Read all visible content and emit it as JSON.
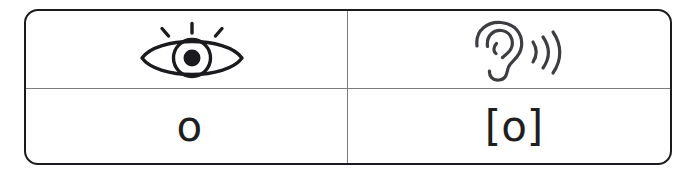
{
  "figure": {
    "type": "two-column-comparison-table",
    "columns": 2,
    "rows": 2,
    "border_color": "#1b1b1f",
    "divider_color": "#7b7b80",
    "background_color": "#ffffff",
    "glyph_color": "#1f1f22"
  },
  "table": {
    "header_row": {
      "cells": [
        {
          "icon": "eye-icon",
          "icon_label": "eye",
          "meaning": "sight / written form"
        },
        {
          "icon": "ear-icon",
          "icon_label": "ear",
          "meaning": "hearing / spoken form"
        }
      ]
    },
    "value_row": {
      "cells": [
        {
          "text": "o",
          "notation": "orthographic letter"
        },
        {
          "text": "[o]",
          "notation": "phonetic transcription"
        }
      ]
    }
  }
}
